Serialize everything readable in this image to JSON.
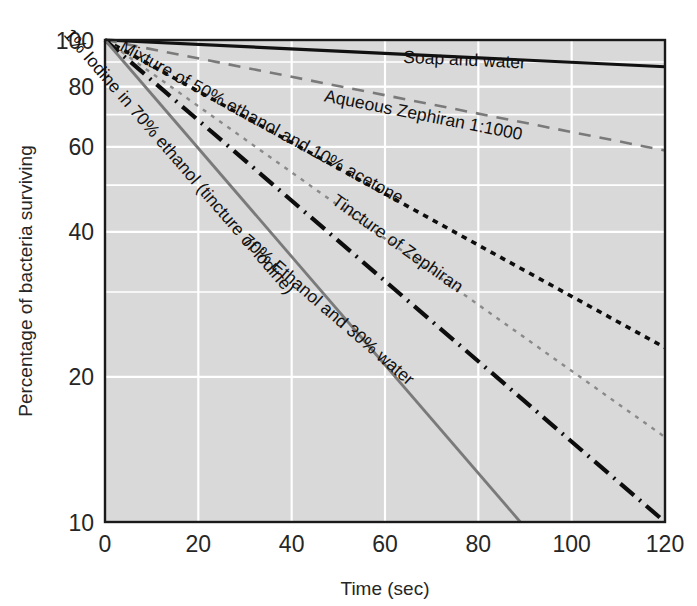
{
  "chart_data": {
    "type": "line",
    "title": "",
    "xlabel": "Time (sec)",
    "ylabel": "Percentage of bacteria surviving",
    "xlim": [
      0,
      120
    ],
    "ylim": [
      10,
      100
    ],
    "yscale": "log",
    "xticks": [
      "0",
      "20",
      "40",
      "60",
      "80",
      "100",
      "120"
    ],
    "xtick_values": [
      0,
      20,
      40,
      60,
      80,
      100,
      120
    ],
    "yticks": [
      "10",
      "20",
      "40",
      "60",
      "80",
      "100"
    ],
    "ytick_values": [
      10,
      20,
      40,
      60,
      80,
      100
    ],
    "minor_gridlines": [
      20,
      30,
      40,
      50,
      60,
      70,
      80,
      90
    ],
    "grid": true,
    "grid_color": "#ffffff",
    "plot_background": "#d9d9d9",
    "legend": "inline-labels",
    "series": [
      {
        "name": "Soap and water",
        "label": "Soap and water",
        "style": "solid",
        "color": "#111111",
        "width": 3.2,
        "label_x": 77,
        "label_y": 88.5,
        "x": [
          0,
          120
        ],
        "y": [
          100,
          88
        ]
      },
      {
        "name": "Aqueous Zephiran 1:1000",
        "label": "Aqueous Zephiran 1:1000",
        "style": "dashed",
        "color": "#7a7a7a",
        "width": 2.6,
        "label_x": 68,
        "label_y": 68,
        "x": [
          0,
          120
        ],
        "y": [
          100,
          59
        ]
      },
      {
        "name": "Mixture of 50% ethanol and 10% acetone",
        "label": "Mixture of 50% ethanol and 10% acetone",
        "style": "dotted",
        "color": "#0d0d0d",
        "width": 3.6,
        "label_x": 33,
        "label_y": 66,
        "x": [
          0,
          120
        ],
        "y": [
          100,
          23
        ]
      },
      {
        "name": "Tincture of Zephiran",
        "label": "Tincture of Zephiran",
        "style": "fine-dotted",
        "color": "#8a8a8a",
        "width": 2.4,
        "label_x": 62,
        "label_y": 37,
        "x": [
          0,
          120
        ],
        "y": [
          100,
          15
        ]
      },
      {
        "name": "70% Ethanol and 30% water",
        "label": "70% Ethanol and 30% water",
        "style": "dash-dot",
        "color": "#0d0d0d",
        "width": 4.2,
        "label_x": 47,
        "label_y": 27,
        "x": [
          0,
          120
        ],
        "y": [
          100,
          10
        ]
      },
      {
        "name": "1% Iodine in 70% ethanol (tincture of iodine)",
        "label": "1% Iodine in 70% ethanol (tincture of iodine)",
        "style": "solid",
        "color": "#7a7a7a",
        "width": 2.8,
        "label_x": 15,
        "label_y": 55,
        "x": [
          0,
          89
        ],
        "y": [
          100,
          10
        ]
      }
    ]
  },
  "axis": {
    "x_title": "Time (sec)",
    "y_title": "Percentage of bacteria surviving"
  },
  "ticks": {
    "x": [
      "0",
      "20",
      "40",
      "60",
      "80",
      "100",
      "120"
    ],
    "y": [
      "100",
      "80",
      "60",
      "40",
      "20",
      "10"
    ]
  },
  "curve_labels": {
    "soap": "Soap and water",
    "aqueous_zephiran": "Aqueous Zephiran 1:1000",
    "mixture": "Mixture of 50% ethanol and 10% acetone",
    "tincture_zephiran": "Tincture of Zephiran",
    "ethanol_water": "70% Ethanol and 30% water",
    "iodine": "1% Iodine in 70% ethanol (tincture of iodine)"
  }
}
